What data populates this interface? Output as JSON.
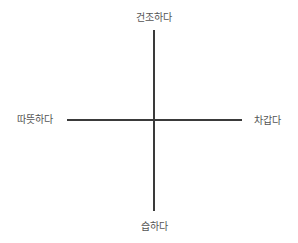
{
  "diagram": {
    "type": "quadrant-axes",
    "axes": {
      "vertical": {
        "top_label": "건조하다",
        "bottom_label": "습하다"
      },
      "horizontal": {
        "left_label": "따뜻하다",
        "right_label": "차갑다"
      }
    },
    "colors": {
      "line": "#3a3a3a",
      "text": "#555555",
      "background": "#ffffff"
    }
  }
}
